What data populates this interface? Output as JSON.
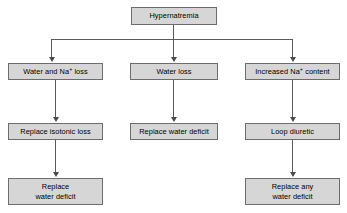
{
  "diagram": {
    "style": {
      "node_fill": "#d6d6d6",
      "node_border": "#6d6d6d",
      "connector": "#5a5a5a",
      "arrow": "#4a4a4a",
      "text": "#000000",
      "background": "#ffffff"
    },
    "nodes": [
      {
        "id": "root",
        "label": "Hypernatremia",
        "superscript": "",
        "x": 131,
        "y": 7,
        "w": 86,
        "h": 18,
        "row": 0
      },
      {
        "id": "water-and-na-loss",
        "label_pre": "Water and Na",
        "superscript": "+",
        "label_post": " loss",
        "label": "Water and Na+ loss",
        "x": 8,
        "y": 63,
        "w": 95,
        "h": 17,
        "row": 1
      },
      {
        "id": "water-loss",
        "label": "Water loss",
        "superscript": "",
        "x": 130,
        "y": 63,
        "w": 88,
        "h": 17,
        "row": 1
      },
      {
        "id": "increased-na-content",
        "label_pre": "Increased Na",
        "superscript": "+",
        "label_post": " content",
        "label": "Increased Na+ content",
        "x": 245,
        "y": 63,
        "w": 95,
        "h": 17,
        "row": 1
      },
      {
        "id": "replace-isotonic-loss",
        "label": "Replace isotonic loss",
        "superscript": "",
        "x": 8,
        "y": 123,
        "w": 95,
        "h": 17,
        "row": 2
      },
      {
        "id": "replace-water-deficit",
        "label": "Replace water deficit",
        "superscript": "",
        "x": 130,
        "y": 123,
        "w": 88,
        "h": 17,
        "row": 2
      },
      {
        "id": "loop-diuretic",
        "label": "Loop diuretic",
        "superscript": "",
        "x": 245,
        "y": 123,
        "w": 95,
        "h": 17,
        "row": 2
      },
      {
        "id": "replace-water-deficit-2",
        "label": "Replace\nwater deficit",
        "superscript": "",
        "x": 8,
        "y": 178,
        "w": 95,
        "h": 27,
        "row": 3
      },
      {
        "id": "replace-any-water-deficit",
        "label": "Replace any\nwater deficit",
        "superscript": "",
        "x": 245,
        "y": 178,
        "w": 95,
        "h": 27,
        "row": 3
      }
    ],
    "edges": [
      {
        "id": "root-to-bus",
        "from": "root",
        "to": "bus"
      },
      {
        "id": "bus-to-water-and-na-loss",
        "from": "bus",
        "to": "water-and-na-loss"
      },
      {
        "id": "bus-to-water-loss",
        "from": "bus",
        "to": "water-loss"
      },
      {
        "id": "bus-to-increased-na-content",
        "from": "bus",
        "to": "increased-na-content"
      },
      {
        "id": "water-and-na-loss-to-replace-isotonic-loss",
        "from": "water-and-na-loss",
        "to": "replace-isotonic-loss"
      },
      {
        "id": "water-loss-to-replace-water-deficit",
        "from": "water-loss",
        "to": "replace-water-deficit"
      },
      {
        "id": "increased-na-content-to-loop-diuretic",
        "from": "increased-na-content",
        "to": "loop-diuretic"
      },
      {
        "id": "replace-isotonic-loss-to-replace-water-deficit-2",
        "from": "replace-isotonic-loss",
        "to": "replace-water-deficit-2"
      },
      {
        "id": "loop-diuretic-to-replace-any-water-deficit",
        "from": "loop-diuretic",
        "to": "replace-any-water-deficit"
      }
    ]
  }
}
